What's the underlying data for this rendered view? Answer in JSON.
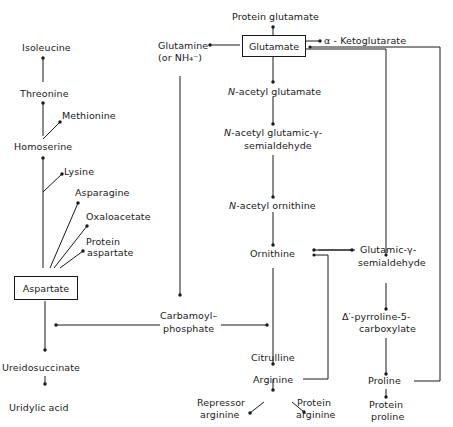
{
  "diagram": {
    "nodes": {
      "isoleucine": "Isoleucine",
      "threonine": "Threonine",
      "methionine": "Methionine",
      "homoserine": "Homoserine",
      "lysine": "Lysine",
      "asparagine": "Asparagine",
      "oxaloacetate": "Oxaloacetate",
      "protein_aspartate_1": "Protein",
      "protein_aspartate_2": "aspartate",
      "aspartate": "Aspartate",
      "ureidosuccinate": "Ureidosuccinate",
      "uridylic_acid": "Uridylic acid",
      "protein_glutamate": "Protein glutamate",
      "glutamate": "Glutamate",
      "alpha_ketoglutarate": "α - Ketoglutarate",
      "glutamine_1": "Glutamine",
      "glutamine_2": "(or NH₄⁻)",
      "n_acetyl_glutamate_prefix": "N",
      "n_acetyl_glutamate": "-acetyl glutamate",
      "n_acetyl_glutamic_prefix": "N",
      "n_acetyl_glutamic_1": "-acetyl glutamic-γ-",
      "n_acetyl_glutamic_2": "semialdehyde",
      "n_acetyl_ornithine_prefix": "N",
      "n_acetyl_ornithine": "-acetyl ornithine",
      "ornithine": "Ornithine",
      "glutamic_semialdehyde_1": "Glutamic-γ-",
      "glutamic_semialdehyde_2": "semialdehyde",
      "carbamoyl_1": "Carbamoyl–",
      "carbamoyl_2": "phosphate",
      "pyrroline_1": "Δ′-pyrroline-5-",
      "pyrroline_2": "carboxylate",
      "citrulline": "Citrulline",
      "arginine": "Arginine",
      "repressor_arginine_1": "Repressor",
      "repressor_arginine_2": "arginine",
      "protein_arginine_1": "Protein",
      "protein_arginine_2": "arginine",
      "proline": "Proline",
      "protein_proline_1": "Protein",
      "protein_proline_2": "proline"
    },
    "edges": [
      {
        "from": "Threonine",
        "to": "Isoleucine"
      },
      {
        "from": "Homoserine",
        "to": "Threonine"
      },
      {
        "from": "Homoserine",
        "to": "Methionine"
      },
      {
        "from": "Aspartate",
        "to": "Homoserine"
      },
      {
        "from": "Aspartate",
        "to": "Lysine"
      },
      {
        "from": "Aspartate",
        "to": "Asparagine"
      },
      {
        "from": "Aspartate",
        "to": "Oxaloacetate"
      },
      {
        "from": "Aspartate",
        "to": "Protein aspartate"
      },
      {
        "from": "Aspartate",
        "to": "Ureidosuccinate"
      },
      {
        "from": "Carbamoyl-phosphate",
        "to": "Ureidosuccinate"
      },
      {
        "from": "Ureidosuccinate",
        "to": "Uridylic acid"
      },
      {
        "from": "Glutamate",
        "to": "Protein glutamate"
      },
      {
        "from": "Glutamate",
        "to": "Glutamine (or NH4-)"
      },
      {
        "from": "Glutamate",
        "to": "α-Ketoglutarate"
      },
      {
        "from": "Glutamate",
        "to": "N-acetyl glutamate"
      },
      {
        "from": "Glutamate",
        "to": "Glutamic-γ-semialdehyde"
      },
      {
        "from": "Glutamine (or NH4-)",
        "to": "Carbamoyl-phosphate"
      },
      {
        "from": "N-acetyl glutamate",
        "to": "N-acetyl glutamic-γ-semialdehyde"
      },
      {
        "from": "N-acetyl glutamic-γ-semialdehyde",
        "to": "N-acetyl ornithine"
      },
      {
        "from": "N-acetyl ornithine",
        "to": "Ornithine"
      },
      {
        "from": "Glutamic-γ-semialdehyde",
        "to": "Ornithine"
      },
      {
        "from": "Ornithine",
        "to": "Glutamic-γ-semialdehyde"
      },
      {
        "from": "Ornithine",
        "to": "Citrulline"
      },
      {
        "from": "Carbamoyl-phosphate",
        "to": "Citrulline"
      },
      {
        "from": "Citrulline",
        "to": "Arginine"
      },
      {
        "from": "Arginine",
        "to": "Ornithine"
      },
      {
        "from": "Arginine",
        "to": "Repressor arginine"
      },
      {
        "from": "Arginine",
        "to": "Protein arginine"
      },
      {
        "from": "Glutamic-γ-semialdehyde",
        "to": "Δ′-pyrroline-5-carboxylate"
      },
      {
        "from": "Δ′-pyrroline-5-carboxylate",
        "to": "Proline"
      },
      {
        "from": "Proline",
        "to": "Glutamate"
      },
      {
        "from": "Proline",
        "to": "Protein proline"
      }
    ]
  }
}
